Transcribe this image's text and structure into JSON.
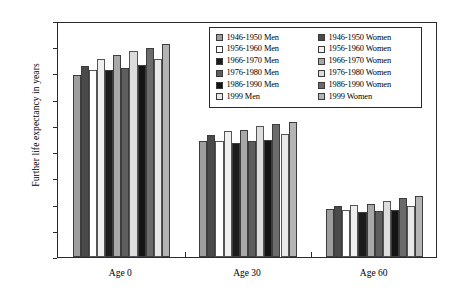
{
  "chart_data": {
    "type": "bar",
    "title": "",
    "xlabel": "",
    "ylabel": "Further life expectancy in years",
    "categories": [
      "Age 0",
      "Age 30",
      "Age 60"
    ],
    "ylim": [
      0,
      90
    ],
    "yticks": [
      0,
      10,
      20,
      30,
      40,
      50,
      60,
      70,
      80,
      90
    ],
    "ytick_labels": [
      "0",
      "10",
      "20",
      "30",
      "40",
      "50",
      "60",
      "70",
      "80",
      "90"
    ],
    "grid": false,
    "legend_position": "top-right",
    "legend_columns": 2,
    "series": [
      {
        "name": "1946-1950 Men",
        "color": "#9e9e9e",
        "values": [
          69.5,
          44.1,
          18.4
        ]
      },
      {
        "name": "1946-1950 Women",
        "color": "#4a4a4a",
        "values": [
          72.8,
          46.4,
          19.3
        ]
      },
      {
        "name": "1956-1960 Men",
        "color": "#ffffff",
        "values": [
          71.2,
          44.4,
          18.1
        ]
      },
      {
        "name": "1956-1960 Women",
        "color": "#efefef",
        "values": [
          75.4,
          48.0,
          19.8
        ]
      },
      {
        "name": "1966-1970 Men",
        "color": "#1c1c1c",
        "values": [
          71.2,
          43.6,
          17.1
        ]
      },
      {
        "name": "1966-1970 Women",
        "color": "#a8a8a8",
        "values": [
          76.9,
          48.4,
          20.4
        ]
      },
      {
        "name": "1976-1980 Men",
        "color": "#5e5e5e",
        "values": [
          72.2,
          44.2,
          17.5
        ]
      },
      {
        "name": "1976-1980 Women",
        "color": "#dcdcdc",
        "values": [
          78.6,
          49.9,
          21.5
        ]
      },
      {
        "name": "1986-1990 Men",
        "color": "#141414",
        "values": [
          73.1,
          44.8,
          18.0
        ]
      },
      {
        "name": "1986-1990 Women",
        "color": "#6b6b6b",
        "values": [
          79.7,
          50.9,
          22.4
        ]
      },
      {
        "name": "1999 Men",
        "color": "#e8e8e8",
        "values": [
          75.6,
          46.9,
          19.4
        ]
      },
      {
        "name": "1999 Women",
        "color": "#b4b4b4",
        "values": [
          81.1,
          51.6,
          23.3
        ]
      }
    ]
  },
  "axes": {
    "y_title": "Further life expectancy in years"
  }
}
